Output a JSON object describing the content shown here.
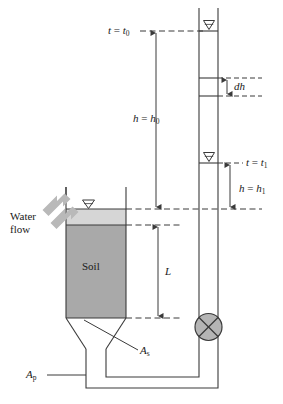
{
  "figure": {
    "domain": "diagram"
  },
  "labels": {
    "t0": "t = t0",
    "t0_var": "t",
    "t0_eq": "=",
    "t0_val": "t",
    "t0_sub": "0",
    "dh": "dh",
    "h0_var": "h",
    "h0_eq": "=",
    "h0_val": "h",
    "h0_sub": "0",
    "t1_var": "t",
    "t1_eq": "=",
    "t1_val": "t",
    "t1_sub": "1",
    "h1_var": "h",
    "h1_eq": "=",
    "h1_val": "h",
    "h1_sub": "1",
    "water_flow_line1": "Water",
    "water_flow_line2": "flow",
    "soil": "Soil",
    "L": "L",
    "As_var": "A",
    "As_sub": "s",
    "Ap_var": "A",
    "Ap_sub": "p"
  },
  "colors": {
    "line": "#3a3a3a",
    "soil_fill": "#a9a9a9",
    "water_fill": "#d6d6d6",
    "valve_fill": "#b5b5b5",
    "arrow_fill": "#b9b9b9",
    "text": "#1a1a1a",
    "background": "#ffffff"
  },
  "geometry": {
    "standpipe_left_x": 199,
    "standpipe_right_x": 218,
    "standpipe_top_y": 8,
    "water_level_t0_y": 31,
    "dh_top_y": 78,
    "dh_bottom_y": 96,
    "water_level_t1_y": 163,
    "datum_y": 209,
    "soil_top_y": 225,
    "soil_bottom_y": 318,
    "valve_y": 327,
    "container_left_x": 66,
    "container_right_x": 126
  },
  "icons": {
    "water_level_marker": "water-level-triangle",
    "valve": "valve-cross-circle",
    "flow_arrow": "flow-arrow-chevron"
  }
}
